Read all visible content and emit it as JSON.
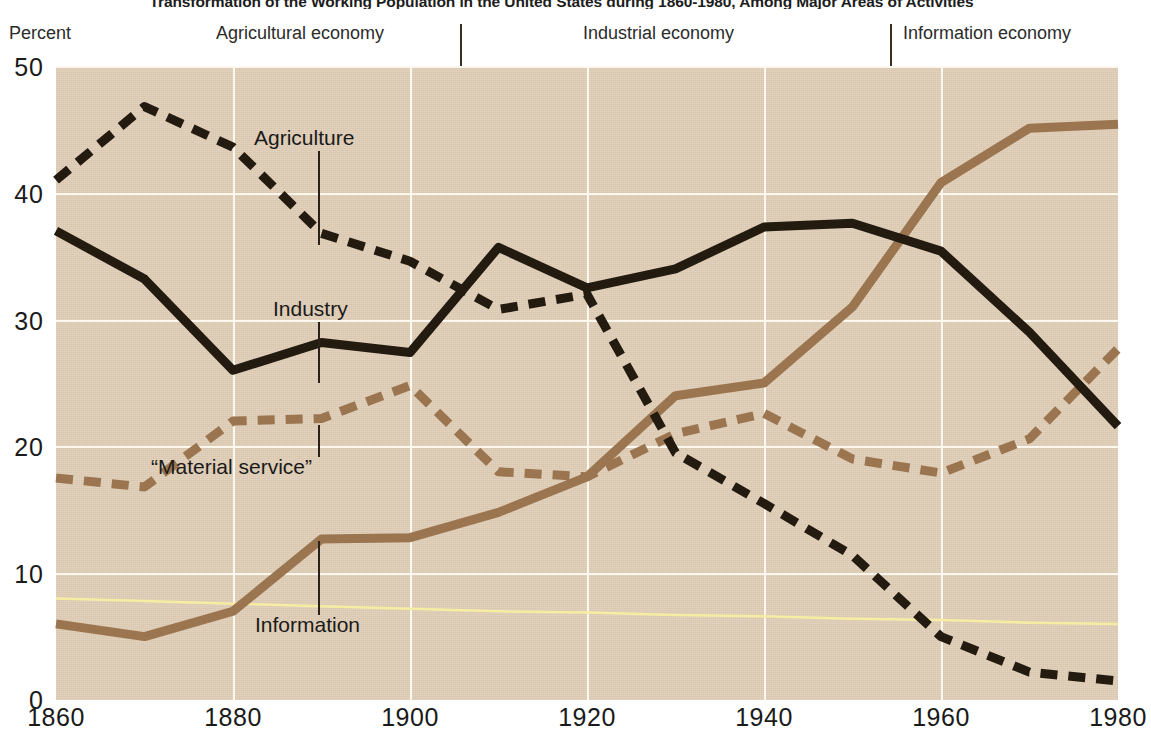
{
  "title": "Transformation of the Working Population in the United States during 1860-1980, Among Major Areas of Activities",
  "axis": {
    "y_name": "Percent",
    "y_ticks": [
      "50",
      "40",
      "30",
      "20",
      "10",
      "0"
    ],
    "x_ticks": [
      "1860",
      "1880",
      "1900",
      "1920",
      "1940",
      "1960",
      "1980"
    ]
  },
  "eras": [
    {
      "label": "Agricultural economy"
    },
    {
      "label": "Industrial economy"
    },
    {
      "label": "Information economy"
    }
  ],
  "annotations": [
    {
      "label": "Agriculture"
    },
    {
      "label": "Industry"
    },
    {
      "label": "“Material service”"
    },
    {
      "label": "Information"
    }
  ],
  "colors": {
    "plot_background": "#d9c6ad",
    "gridline": "#fdf8ef",
    "agriculture": "#231a10",
    "industry": "#231a10",
    "material_service": "#9a7550",
    "information": "#9a7550",
    "extra_line": "#f6eda2",
    "text": "#1a1a1a"
  },
  "chart_data": {
    "type": "line",
    "title": "Transformation of the Working Population in the United States during 1860-1980, Among Major Areas of Activities",
    "xlabel": "",
    "ylabel": "Percent",
    "xlim": [
      1860,
      1980
    ],
    "ylim": [
      0,
      50
    ],
    "grid": true,
    "legend": "in-plot annotations",
    "x": [
      1860,
      1870,
      1880,
      1890,
      1900,
      1910,
      1920,
      1930,
      1940,
      1950,
      1960,
      1970,
      1980
    ],
    "series": [
      {
        "name": "Agriculture",
        "style": "dashed",
        "color": "#231a10",
        "values": [
          41.0,
          46.8,
          43.6,
          36.8,
          34.6,
          30.8,
          32.0,
          19.5,
          15.5,
          11.4,
          5.0,
          2.2,
          1.5
        ]
      },
      {
        "name": "Industry",
        "style": "solid",
        "color": "#231a10",
        "values": [
          37.0,
          33.2,
          26.0,
          28.2,
          27.4,
          35.7,
          32.5,
          34.0,
          37.3,
          37.6,
          35.4,
          29.0,
          21.6
        ]
      },
      {
        "name": "“Material service”",
        "style": "dashed",
        "color": "#9a7550",
        "values": [
          17.5,
          16.8,
          22.0,
          22.2,
          24.8,
          18.0,
          17.6,
          21.0,
          22.6,
          19.0,
          17.9,
          20.6,
          27.7
        ]
      },
      {
        "name": "Information",
        "style": "solid",
        "color": "#9a7550",
        "values": [
          6.0,
          5.0,
          7.0,
          12.7,
          12.8,
          14.8,
          17.6,
          24.0,
          25.0,
          31.0,
          40.8,
          45.1,
          45.4
        ]
      },
      {
        "name": "unlabeled-pale-line",
        "style": "solid",
        "color": "#f6eda2",
        "values": [
          8.0,
          7.8,
          7.6,
          7.4,
          7.2,
          7.0,
          6.9,
          6.7,
          6.6,
          6.4,
          6.3,
          6.1,
          6.0
        ]
      }
    ],
    "era_bands": [
      {
        "label": "Agricultural economy",
        "start": 1860,
        "end": 1907
      },
      {
        "label": "Industrial economy",
        "start": 1907,
        "end": 1955
      },
      {
        "label": "Information economy",
        "start": 1955,
        "end": 1980
      }
    ]
  }
}
